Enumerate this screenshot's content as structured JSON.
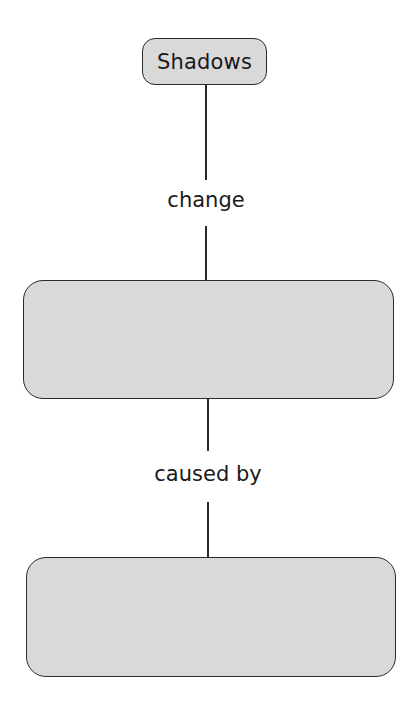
{
  "diagram": {
    "type": "concept-map",
    "nodes": [
      {
        "id": "shadows",
        "label": "Shadows",
        "fill": "#d9d9d9"
      },
      {
        "id": "blank1",
        "label": "",
        "fill": "#d9d9d9"
      },
      {
        "id": "blank2",
        "label": "",
        "fill": "#d9d9d9"
      }
    ],
    "edges": [
      {
        "from": "shadows",
        "to": "blank1",
        "label": "change"
      },
      {
        "from": "blank1",
        "to": "blank2",
        "label": "caused by"
      }
    ]
  }
}
